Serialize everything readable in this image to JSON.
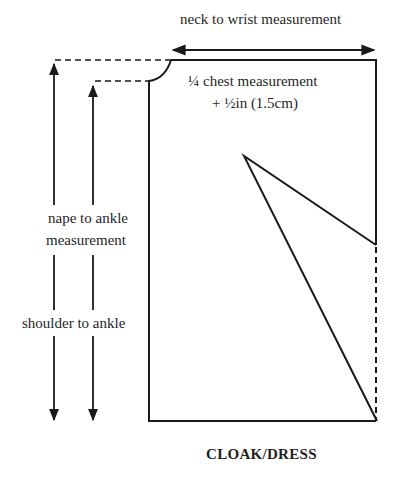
{
  "diagram": {
    "title": "CLOAK/DRESS",
    "labels": {
      "neck_to_wrist": "neck to wrist measurement",
      "chest_line1": "¼ chest measurement",
      "chest_line2": "+ ½in (1.5cm)",
      "nape_line1": "nape to ankle",
      "nape_line2": "measurement",
      "shoulder": "shoulder to ankle"
    },
    "colors": {
      "line": "#1a1a1a",
      "background": "#ffffff"
    }
  }
}
